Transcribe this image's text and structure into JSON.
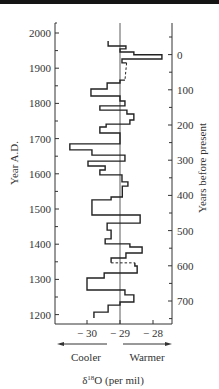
{
  "chart_data": {
    "type": "line",
    "subtype": "step-profile",
    "title": "",
    "xlabel": "δ18O (per mil)",
    "ylabel_left": "Year A.D.",
    "ylabel_right": "Years before present",
    "x_direction_labels": {
      "left": "Cooler",
      "right": "Warmer"
    },
    "xlim": [
      -31.0,
      -27.4
    ],
    "ylim": [
      1180,
      2000
    ],
    "x_ticks": [
      {
        "value": -30,
        "label": "− 30"
      },
      {
        "value": -29,
        "label": "− 29"
      },
      {
        "value": -28,
        "label": "− 28"
      }
    ],
    "y_ticks_left": [
      {
        "value": 2000,
        "label": "2000"
      },
      {
        "value": 1900,
        "label": "1900"
      },
      {
        "value": 1800,
        "label": "1800"
      },
      {
        "value": 1700,
        "label": "1700"
      },
      {
        "value": 1600,
        "label": "1600"
      },
      {
        "value": 1500,
        "label": "1500"
      },
      {
        "value": 1400,
        "label": "1400"
      },
      {
        "value": 1300,
        "label": "1300"
      },
      {
        "value": 1200,
        "label": "1200"
      }
    ],
    "y_ticks_right": [
      {
        "bp": 0,
        "label": "0"
      },
      {
        "bp": 100,
        "label": "100"
      },
      {
        "bp": 200,
        "label": "200"
      },
      {
        "bp": 300,
        "label": "300"
      },
      {
        "bp": 400,
        "label": "400"
      },
      {
        "bp": 500,
        "label": "500"
      },
      {
        "bp": 600,
        "label": "600"
      },
      {
        "bp": 700,
        "label": "700"
      }
    ],
    "present_year": 1950,
    "reference_line": {
      "x": -29.0
    },
    "grid": false,
    "legend": null,
    "series": [
      {
        "name": "δ18O step profile",
        "steps": [
          {
            "from": 1977,
            "to": 1963,
            "value": -29.36
          },
          {
            "from": 1963,
            "to": 1955,
            "value": -28.82
          },
          {
            "from": 1955,
            "to": 1946,
            "value": -29.0
          },
          {
            "from": 1946,
            "to": 1938,
            "value": -28.58
          },
          {
            "from": 1938,
            "to": 1926,
            "value": -27.73
          },
          {
            "from": 1926,
            "to": 1915,
            "value": -28.94
          },
          {
            "from": 1915,
            "to": 1866,
            "value": -28.8,
            "dashed": true,
            "value_end": -28.85
          },
          {
            "from": 1866,
            "to": 1858,
            "value": -29.0
          },
          {
            "from": 1858,
            "to": 1841,
            "value": -29.39
          },
          {
            "from": 1841,
            "to": 1821,
            "value": -29.88
          },
          {
            "from": 1821,
            "to": 1807,
            "value": -29.0
          },
          {
            "from": 1807,
            "to": 1793,
            "value": -28.85
          },
          {
            "from": 1793,
            "to": 1781,
            "value": -29.61
          },
          {
            "from": 1781,
            "to": 1770,
            "value": -28.79
          },
          {
            "from": 1770,
            "to": 1753,
            "value": -28.58
          },
          {
            "from": 1753,
            "to": 1741,
            "value": -28.7
          },
          {
            "from": 1741,
            "to": 1733,
            "value": -29.42
          },
          {
            "from": 1733,
            "to": 1716,
            "value": -29.61
          },
          {
            "from": 1716,
            "to": 1685,
            "value": -29.0
          },
          {
            "from": 1685,
            "to": 1668,
            "value": -30.52
          },
          {
            "from": 1668,
            "to": 1653,
            "value": -29.85
          },
          {
            "from": 1653,
            "to": 1636,
            "value": -28.85
          },
          {
            "from": 1636,
            "to": 1622,
            "value": -29.97
          },
          {
            "from": 1622,
            "to": 1611,
            "value": -29.45
          },
          {
            "from": 1611,
            "to": 1597,
            "value": -29.61
          },
          {
            "from": 1597,
            "to": 1577,
            "value": -28.94
          },
          {
            "from": 1577,
            "to": 1565,
            "value": -28.76
          },
          {
            "from": 1565,
            "to": 1534,
            "value": -28.93
          },
          {
            "from": 1534,
            "to": 1526,
            "value": -29.27
          },
          {
            "from": 1526,
            "to": 1483,
            "value": -29.85
          },
          {
            "from": 1483,
            "to": 1460,
            "value": -28.39
          },
          {
            "from": 1460,
            "to": 1440,
            "value": -29.39
          },
          {
            "from": 1440,
            "to": 1415,
            "value": -29.27
          },
          {
            "from": 1415,
            "to": 1401,
            "value": -29.45
          },
          {
            "from": 1401,
            "to": 1392,
            "value": -28.7
          },
          {
            "from": 1392,
            "to": 1375,
            "value": -28.33
          },
          {
            "from": 1375,
            "to": 1361,
            "value": -28.82
          },
          {
            "from": 1361,
            "to": 1347,
            "value": -29.27,
            "dashed_connector_to": -28.55
          },
          {
            "from": 1347,
            "to": 1338,
            "value": -28.55
          },
          {
            "from": 1338,
            "to": 1318,
            "value": -28.48
          },
          {
            "from": 1318,
            "to": 1304,
            "value": -29.48
          },
          {
            "from": 1304,
            "to": 1270,
            "value": -30.0
          },
          {
            "from": 1270,
            "to": 1256,
            "value": -28.85
          },
          {
            "from": 1256,
            "to": 1236,
            "value": -28.58
          },
          {
            "from": 1236,
            "to": 1227,
            "value": -29.0
          },
          {
            "from": 1227,
            "to": 1207,
            "value": -29.36
          },
          {
            "from": 1207,
            "to": 1190,
            "value": -29.79
          }
        ]
      }
    ]
  },
  "labels": {
    "y_left_title": "Year A.D.",
    "y_right_title": "Years before present",
    "x_title": "δ18O (per mil)",
    "x_title_prefix": "δ",
    "x_title_sup": "18",
    "x_title_suffix": "O (per mil)",
    "cooler": "Cooler",
    "warmer": "Warmer"
  },
  "colors": {
    "ink": "#222222",
    "axis": "#333333",
    "background": "#ffffff",
    "top_bar": "#151515"
  }
}
